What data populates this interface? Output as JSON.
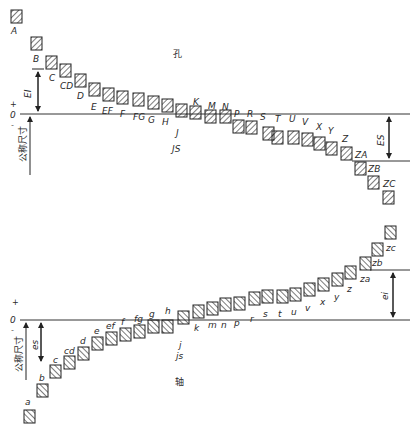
{
  "hole": {
    "title": "孔",
    "zero_label": "0",
    "plus_label": "+",
    "minus_label": "-",
    "basic_size_label": "公称尺寸",
    "ei_label": "EI",
    "es_label": "ES",
    "zero_y": 114,
    "boxes": [
      {
        "label": "A",
        "x": 11,
        "y": 10,
        "lx": 11,
        "ly": 34
      },
      {
        "label": "B",
        "x": 31,
        "y": 37,
        "lx": 33,
        "ly": 62
      },
      {
        "label": "C",
        "x": 46,
        "y": 56,
        "lx": 49,
        "ly": 81
      },
      {
        "label": "CD",
        "x": 60,
        "y": 64,
        "lx": 60,
        "ly": 89
      },
      {
        "label": "D",
        "x": 75,
        "y": 74,
        "lx": 77,
        "ly": 99
      },
      {
        "label": "E",
        "x": 89,
        "y": 83,
        "lx": 91,
        "ly": 110
      },
      {
        "label": "EF",
        "x": 103,
        "y": 88,
        "lx": 102,
        "ly": 114
      },
      {
        "label": "F",
        "x": 117,
        "y": 91,
        "lx": 120,
        "ly": 117
      },
      {
        "label": "FG",
        "x": 133,
        "y": 93,
        "lx": 133,
        "ly": 120
      },
      {
        "label": "G",
        "x": 148,
        "y": 96,
        "lx": 148,
        "ly": 123
      },
      {
        "label": "H",
        "x": 162,
        "y": 99,
        "lx": 162,
        "ly": 125
      },
      {
        "label": "J",
        "x": 176,
        "y": 104,
        "lx": 176,
        "ly": 136
      },
      {
        "label": "K",
        "x": 190,
        "y": 106,
        "lx": 193,
        "ly": 105
      },
      {
        "label": "M",
        "x": 205,
        "y": 110,
        "lx": 208,
        "ly": 109
      },
      {
        "label": "N",
        "x": 220,
        "y": 110,
        "lx": 222,
        "ly": 110
      },
      {
        "label": "P",
        "x": 233,
        "y": 120,
        "lx": 234,
        "ly": 117
      },
      {
        "label": "R",
        "x": 246,
        "y": 121,
        "lx": 247,
        "ly": 117
      },
      {
        "label": "S",
        "x": 263,
        "y": 127,
        "lx": 260,
        "ly": 120
      },
      {
        "label": "T",
        "x": 272,
        "y": 131,
        "lx": 275,
        "ly": 122
      },
      {
        "label": "U",
        "x": 288,
        "y": 131,
        "lx": 289,
        "ly": 122
      },
      {
        "label": "V",
        "x": 302,
        "y": 133,
        "lx": 302,
        "ly": 125
      },
      {
        "label": "X",
        "x": 314,
        "y": 137,
        "lx": 316,
        "ly": 130
      },
      {
        "label": "Y",
        "x": 326,
        "y": 142,
        "lx": 328,
        "ly": 134
      },
      {
        "label": "Z",
        "x": 341,
        "y": 147,
        "lx": 342,
        "ly": 142
      },
      {
        "label": "ZA",
        "x": 355,
        "y": 162,
        "lx": 355,
        "ly": 158
      },
      {
        "label": "ZB",
        "x": 368,
        "y": 176,
        "lx": 368,
        "ly": 172
      },
      {
        "label": "ZC",
        "x": 383,
        "y": 191,
        "lx": 383,
        "ly": 187
      }
    ],
    "js_label": "JS"
  },
  "shaft": {
    "title": "轴",
    "zero_label": "0",
    "plus_label": "+",
    "minus_label": "-",
    "basic_size_label": "公称尺寸",
    "es_label": "es",
    "ei_label": "ei",
    "zero_y": 320,
    "boxes": [
      {
        "label": "a",
        "x": 24,
        "y": 410,
        "lx": 25,
        "ly": 405
      },
      {
        "label": "b",
        "x": 37,
        "y": 384,
        "lx": 39,
        "ly": 381
      },
      {
        "label": "c",
        "x": 50,
        "y": 365,
        "lx": 53,
        "ly": 363
      },
      {
        "label": "cd",
        "x": 64,
        "y": 356,
        "lx": 64,
        "ly": 354
      },
      {
        "label": "d",
        "x": 78,
        "y": 347,
        "lx": 80,
        "ly": 344
      },
      {
        "label": "e",
        "x": 92,
        "y": 337,
        "lx": 94,
        "ly": 334
      },
      {
        "label": "ef",
        "x": 106,
        "y": 332,
        "lx": 106,
        "ly": 329
      },
      {
        "label": "f",
        "x": 120,
        "y": 328,
        "lx": 121,
        "ly": 325
      },
      {
        "label": "fg",
        "x": 134,
        "y": 325,
        "lx": 134,
        "ly": 322
      },
      {
        "label": "g",
        "x": 148,
        "y": 320,
        "lx": 149,
        "ly": 317
      },
      {
        "label": "h",
        "x": 162,
        "y": 320,
        "lx": 165,
        "ly": 314
      },
      {
        "label": "j",
        "x": 178,
        "y": 311,
        "lx": 179,
        "ly": 348
      },
      {
        "label": "k",
        "x": 193,
        "y": 305,
        "lx": 194,
        "ly": 331
      },
      {
        "label": "m",
        "x": 207,
        "y": 302,
        "lx": 208,
        "ly": 328
      },
      {
        "label": "n",
        "x": 220,
        "y": 298,
        "lx": 221,
        "ly": 328
      },
      {
        "label": "p",
        "x": 234,
        "y": 297,
        "lx": 234,
        "ly": 326
      },
      {
        "label": "r",
        "x": 249,
        "y": 292,
        "lx": 250,
        "ly": 322
      },
      {
        "label": "s",
        "x": 262,
        "y": 290,
        "lx": 263,
        "ly": 317
      },
      {
        "label": "t",
        "x": 277,
        "y": 290,
        "lx": 278,
        "ly": 317
      },
      {
        "label": "u",
        "x": 290,
        "y": 288,
        "lx": 291,
        "ly": 315
      },
      {
        "label": "v",
        "x": 304,
        "y": 283,
        "lx": 305,
        "ly": 311
      },
      {
        "label": "x",
        "x": 318,
        "y": 278,
        "lx": 320,
        "ly": 305
      },
      {
        "label": "y",
        "x": 332,
        "y": 273,
        "lx": 334,
        "ly": 300
      },
      {
        "label": "z",
        "x": 345,
        "y": 266,
        "lx": 347,
        "ly": 292
      },
      {
        "label": "za",
        "x": 360,
        "y": 257,
        "lx": 360,
        "ly": 282
      },
      {
        "label": "zb",
        "x": 372,
        "y": 243,
        "lx": 372,
        "ly": 266
      },
      {
        "label": "zc",
        "x": 385,
        "y": 226,
        "lx": 386,
        "ly": 251
      }
    ],
    "js_label": "js"
  }
}
